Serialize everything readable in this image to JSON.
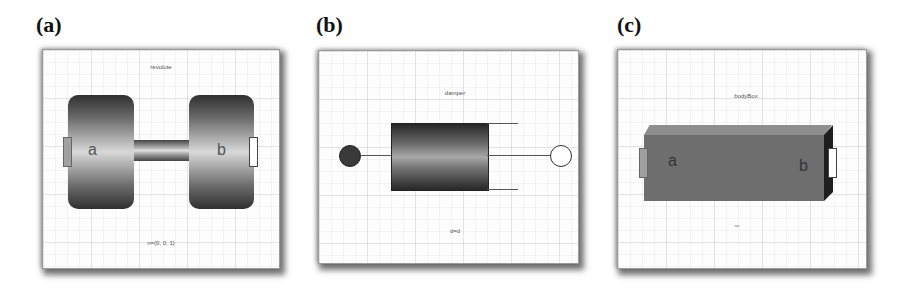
{
  "figure": {
    "panels": [
      {
        "id": "a",
        "label": "(a)",
        "component": "revolute",
        "top_text": "revolute",
        "bottom_text": "n={0, 0, 1}",
        "ports": {
          "left": "a",
          "right": "b"
        }
      },
      {
        "id": "b",
        "label": "(b)",
        "component": "damper",
        "top_text": "damper",
        "bottom_text": "d=d"
      },
      {
        "id": "c",
        "label": "(c)",
        "component": "bodyBox",
        "top_text": "bodyBox",
        "bottom_text": "r=r",
        "ports": {
          "left": "a",
          "right": "b"
        }
      }
    ]
  }
}
